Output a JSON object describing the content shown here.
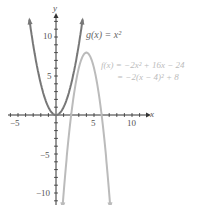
{
  "chart_data": {
    "type": "line",
    "title": "",
    "xlabel": "x",
    "ylabel": "y",
    "xlim": [
      -6,
      12
    ],
    "ylim": [
      -11,
      13
    ],
    "x_ticks": [
      "-5",
      "5",
      "10"
    ],
    "y_ticks": [
      "10",
      "5",
      "-5",
      "-10"
    ],
    "grid": false,
    "series": [
      {
        "name": "g(x) = x^2",
        "formula": "x^2",
        "color": "#777777",
        "x": [
          -3.5,
          -3,
          -2,
          -1,
          0,
          1,
          2,
          3,
          3.5
        ],
        "values": [
          12.25,
          9,
          4,
          1,
          0,
          1,
          4,
          9,
          12.25
        ]
      },
      {
        "name": "f(x) = -2x^2 + 16x - 24 = -2(x - 4)^2 + 8",
        "formula": "-2(x-4)^2+8",
        "color": "#bbbbbb",
        "x": [
          0.9,
          2,
          3,
          4,
          5,
          6,
          7.1
        ],
        "values": [
          -11.2,
          0,
          6,
          8,
          6,
          0,
          -11.2
        ]
      }
    ],
    "annotations": [
      "g(x) = x²",
      "f(x) = −2x² + 16x − 24",
      "= −2(x − 4)² + 8"
    ]
  },
  "labels": {
    "x_axis": "x",
    "y_axis": "y",
    "xt_m5": "−5",
    "xt_5": "5",
    "xt_10": "10",
    "yt_10": "10",
    "yt_5": "5",
    "yt_m5": "−5",
    "yt_m10": "−10",
    "g_eq": "g(x) = x²",
    "f_eq1": "f(x) = −2x² + 16x − 24",
    "f_eq2": "= −2(x − 4)² + 8"
  }
}
